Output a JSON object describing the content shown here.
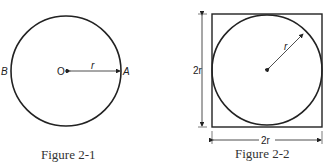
{
  "figures": [
    {
      "caption": "Figure 2-1",
      "labels": {
        "left_point": "B",
        "center": "O",
        "right_point": "A",
        "radius": "r"
      }
    },
    {
      "caption": "Figure 2-2",
      "labels": {
        "radius": "r",
        "height": "2r",
        "width": "2r"
      }
    }
  ],
  "colors": {
    "stroke": "#222222",
    "background": "#ffffff"
  }
}
